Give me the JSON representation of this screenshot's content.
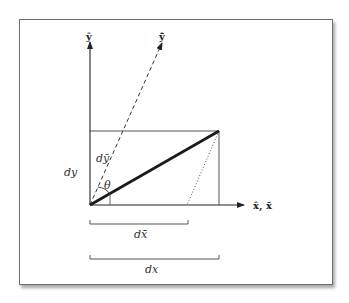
{
  "colors": {
    "line": "#222222",
    "thin_line": "#555555",
    "text": "#333333",
    "frame": "#6e6e6e"
  },
  "labels": {
    "y_axis": "ŷ",
    "y_bar_axis": "ŷ̄",
    "x_axis": "x̂, x̄",
    "dy": "dy",
    "dy_bar": "dȳ",
    "theta": "θ",
    "dx_bar": "dx̄",
    "dx": "dx"
  },
  "geometry": {
    "origin": [
      90,
      205
    ],
    "y_axis_top": [
      90,
      40
    ],
    "y_bar_axis_top": [
      163,
      40
    ],
    "x_axis_right": [
      246,
      205
    ],
    "rect_top_right": [
      219,
      131
    ],
    "dotted_end": [
      187,
      205
    ],
    "dx_bar_bracket": [
      90,
      188,
      224
    ],
    "dx_bracket": [
      90,
      219,
      259
    ]
  }
}
